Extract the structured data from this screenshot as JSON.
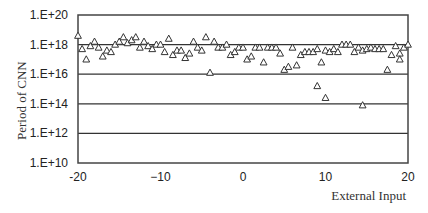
{
  "chart_data": {
    "type": "scatter",
    "title": "",
    "xlabel": "External Input",
    "ylabel": "Period of CNN",
    "xlim": [
      -20,
      20
    ],
    "ylim": [
      10000000000.0,
      1e+20
    ],
    "yscale": "log",
    "x_ticks": [
      -20,
      -10,
      0,
      10,
      20
    ],
    "x_tick_labels": [
      "-20",
      "−10",
      "0",
      "10",
      "20"
    ],
    "y_ticks": [
      10000000000.0,
      1000000000000.0,
      100000000000000.0,
      1e+16,
      1e+18,
      1e+20
    ],
    "y_tick_labels": [
      "1.E+10",
      "1.E+12",
      "1.E+14",
      "1.E+16",
      "1.E+18",
      "1.E+20"
    ],
    "grid": {
      "horizontal": true,
      "vertical": false,
      "lines_at": [
        1000000000000.0,
        100000000000000.0,
        1e+16,
        1e+18
      ]
    },
    "legend": null,
    "marker": "open-triangle",
    "series": [
      {
        "name": "Period",
        "points_log10": [
          [
            -20.0,
            18.6
          ],
          [
            -19.5,
            17.7
          ],
          [
            -19.0,
            17.0
          ],
          [
            -18.5,
            17.9
          ],
          [
            -18.0,
            18.2
          ],
          [
            -17.5,
            17.8
          ],
          [
            -17.0,
            17.2
          ],
          [
            -16.5,
            17.6
          ],
          [
            -16.0,
            17.5
          ],
          [
            -15.5,
            18.0
          ],
          [
            -15.0,
            18.2
          ],
          [
            -14.5,
            18.5
          ],
          [
            -14.0,
            18.1
          ],
          [
            -13.5,
            18.3
          ],
          [
            -13.0,
            18.5
          ],
          [
            -12.5,
            17.8
          ],
          [
            -12.0,
            18.2
          ],
          [
            -11.5,
            17.9
          ],
          [
            -11.0,
            17.7
          ],
          [
            -10.5,
            18.0
          ],
          [
            -10.0,
            18.0
          ],
          [
            -9.5,
            17.5
          ],
          [
            -9.0,
            18.4
          ],
          [
            -8.5,
            17.3
          ],
          [
            -8.0,
            17.6
          ],
          [
            -7.5,
            17.6
          ],
          [
            -7.0,
            17.1
          ],
          [
            -6.5,
            17.4
          ],
          [
            -6.0,
            18.2
          ],
          [
            -5.5,
            17.8
          ],
          [
            -5.0,
            17.6
          ],
          [
            -4.5,
            18.5
          ],
          [
            -4.0,
            16.1
          ],
          [
            -3.5,
            18.2
          ],
          [
            -3.0,
            17.8
          ],
          [
            -2.5,
            17.8
          ],
          [
            -2.0,
            18.0
          ],
          [
            -1.5,
            17.3
          ],
          [
            -1.0,
            17.5
          ],
          [
            -0.5,
            17.8
          ],
          [
            0.0,
            17.8
          ],
          [
            0.5,
            17.0
          ],
          [
            1.0,
            17.2
          ],
          [
            1.5,
            17.8
          ],
          [
            2.0,
            17.8
          ],
          [
            2.5,
            16.8
          ],
          [
            3.0,
            17.8
          ],
          [
            3.5,
            17.8
          ],
          [
            4.0,
            17.8
          ],
          [
            4.5,
            17.4
          ],
          [
            5.0,
            16.3
          ],
          [
            5.5,
            16.5
          ],
          [
            6.0,
            17.8
          ],
          [
            6.5,
            16.6
          ],
          [
            7.0,
            17.3
          ],
          [
            7.5,
            17.5
          ],
          [
            8.0,
            17.5
          ],
          [
            8.5,
            17.5
          ],
          [
            9.0,
            17.7
          ],
          [
            9.5,
            16.8
          ],
          [
            10.0,
            17.6
          ],
          [
            10.5,
            17.5
          ],
          [
            11.0,
            17.7
          ],
          [
            11.5,
            17.5
          ],
          [
            12.0,
            18.0
          ],
          [
            12.5,
            18.0
          ],
          [
            13.0,
            18.0
          ],
          [
            13.5,
            17.5
          ],
          [
            14.0,
            17.8
          ],
          [
            14.5,
            17.6
          ],
          [
            15.0,
            17.7
          ],
          [
            15.5,
            17.8
          ],
          [
            16.0,
            17.7
          ],
          [
            16.5,
            17.7
          ],
          [
            17.0,
            17.7
          ],
          [
            17.5,
            16.3
          ],
          [
            18.0,
            17.3
          ],
          [
            18.5,
            17.9
          ],
          [
            19.0,
            17.4
          ],
          [
            19.5,
            17.8
          ],
          [
            20.0,
            18.0
          ],
          [
            9.0,
            15.2
          ],
          [
            10.0,
            14.4
          ],
          [
            14.5,
            13.9
          ],
          [
            19.0,
            17.0
          ]
        ]
      }
    ]
  }
}
